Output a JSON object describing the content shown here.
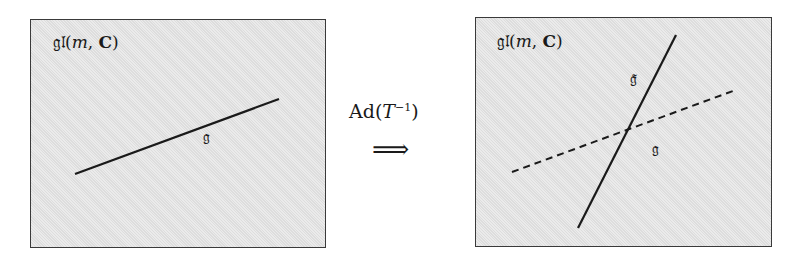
{
  "left_panel": {
    "title": {
      "prefix": "𝔤𝔩(",
      "var": "m",
      "sep": ", ",
      "field": "𝐂",
      "suffix": ")"
    },
    "line_label": "𝔤",
    "line": {
      "x1": 75,
      "y1": 174,
      "x2": 279,
      "y2": 99,
      "style": "solid"
    }
  },
  "transformation": {
    "label_prefix": "Ad(",
    "label_var": "T",
    "label_exp": "−1",
    "label_suffix": ")",
    "arrow": "⟹"
  },
  "right_panel": {
    "title": {
      "prefix": "𝔤𝔩(",
      "var": "m",
      "sep": ", ",
      "field": "𝐂",
      "suffix": ")"
    },
    "transformed_label": "𝔤̃",
    "original_label": "𝔤",
    "transformed_line": {
      "x1": 578,
      "y1": 228,
      "x2": 676,
      "y2": 35,
      "style": "solid"
    },
    "original_line": {
      "x1": 512,
      "y1": 172,
      "x2": 733,
      "y2": 91,
      "style": "dashed"
    }
  },
  "colors": {
    "panel_bg": "#e4e4e4",
    "border": "#3a3a3a",
    "ink": "#1a1a1a"
  }
}
